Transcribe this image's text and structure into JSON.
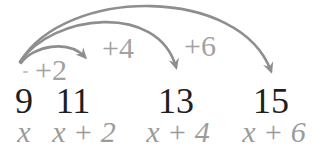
{
  "figure": {
    "colors": {
      "background": "#ffffff",
      "arc": "#8e8e8e",
      "jump_label": "#a2a2a2",
      "number": "#1f1f1f",
      "expression": "#9b9b9b"
    },
    "jumps": [
      {
        "label": "+2",
        "from": "9",
        "to": "11"
      },
      {
        "label": "+4",
        "from": "9",
        "to": "13"
      },
      {
        "label": "+6",
        "from": "9",
        "to": "15"
      }
    ],
    "numbers": [
      "9",
      "11",
      "13",
      "15"
    ],
    "expressions": [
      "x",
      "x + 2",
      "x + 4",
      "x + 6"
    ]
  }
}
